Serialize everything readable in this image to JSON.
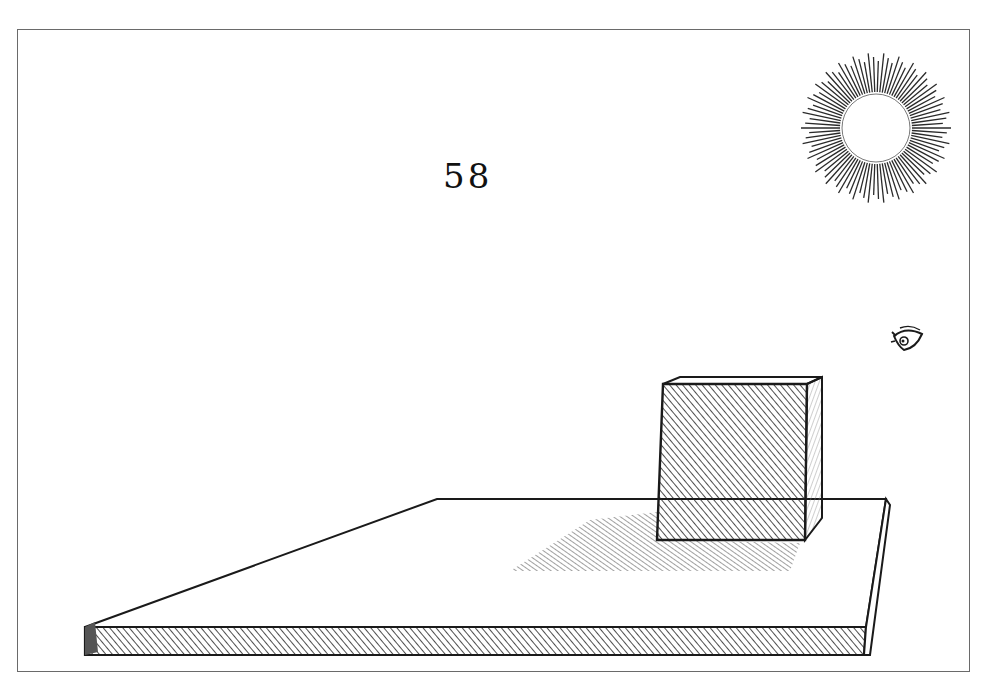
{
  "illustration": {
    "title": "Woodcut perspective plate: cube on a slab casting a shadow from the sun, viewed by an eye",
    "figure_number": "58",
    "elements": {
      "sun": {
        "icon": "sun-icon",
        "center": [
          876,
          128
        ],
        "inner_radius": 34,
        "outer_radius": 75,
        "rays": 90
      },
      "eye": {
        "icon": "eye-icon",
        "position": [
          908,
          340
        ]
      },
      "cube": {
        "icon": "cube-icon",
        "front_face": [
          [
            657,
            384
          ],
          [
            807,
            384
          ],
          [
            807,
            540
          ],
          [
            657,
            540
          ]
        ]
      },
      "slab": {
        "top_face": [
          [
            85,
            627
          ],
          [
            437,
            499
          ],
          [
            886,
            499
          ],
          [
            866,
            627
          ]
        ],
        "front_edge_thickness": 27
      },
      "shadow": {
        "polygon": [
          [
            510,
            571
          ],
          [
            590,
            520
          ],
          [
            657,
            515
          ],
          [
            660,
            540
          ],
          [
            800,
            545
          ],
          [
            780,
            571
          ]
        ]
      }
    },
    "colors": {
      "ink": "#1a1a1a",
      "frame": "#6a6a6a",
      "paper": "#ffffff"
    }
  }
}
